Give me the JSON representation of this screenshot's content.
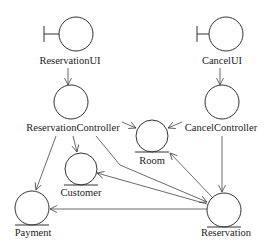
{
  "diagram": {
    "type": "UML robustness diagram",
    "nodes": [
      {
        "id": "reservation_ui",
        "kind": "boundary",
        "label": "ReservationUI"
      },
      {
        "id": "cancel_ui",
        "kind": "boundary",
        "label": "CancelUI"
      },
      {
        "id": "reservation_controller",
        "kind": "control",
        "label": "ReservationController"
      },
      {
        "id": "cancel_controller",
        "kind": "control",
        "label": "CancelController"
      },
      {
        "id": "room",
        "kind": "entity",
        "label": "Room"
      },
      {
        "id": "customer",
        "kind": "entity",
        "label": "Customer"
      },
      {
        "id": "payment",
        "kind": "entity",
        "label": "Payment"
      },
      {
        "id": "reservation",
        "kind": "entity",
        "label": "Reservation"
      }
    ],
    "edges": [
      {
        "from": "ReservationUI",
        "to": "ReservationController"
      },
      {
        "from": "CancelUI",
        "to": "CancelController"
      },
      {
        "from": "ReservationController",
        "to": "Room"
      },
      {
        "from": "CancelController",
        "to": "Room"
      },
      {
        "from": "ReservationController",
        "to": "Customer"
      },
      {
        "from": "ReservationController",
        "to": "Payment"
      },
      {
        "from": "ReservationController",
        "to": "Reservation"
      },
      {
        "from": "CancelController",
        "to": "Reservation"
      },
      {
        "from": "Reservation",
        "to": "Room"
      },
      {
        "from": "Reservation",
        "to": "Customer"
      },
      {
        "from": "Reservation",
        "to": "Payment"
      }
    ]
  },
  "labels": {
    "reservation_ui": "ReservationUI",
    "cancel_ui": "CancelUI",
    "reservation_controller": "ReservationController",
    "cancel_controller": "CancelController",
    "room": "Room",
    "customer": "Customer",
    "payment": "Payment",
    "reservation": "Reservation"
  }
}
